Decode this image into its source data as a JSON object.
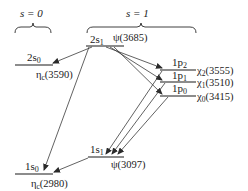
{
  "headers": {
    "s0": "s = 0",
    "s1": "s = 1"
  },
  "levels": {
    "2s1": {
      "state": "2s",
      "sub": "1",
      "particle": "ψ(3685)"
    },
    "2s0": {
      "state": "2s",
      "sub": "0",
      "particle": "η",
      "particle_sub": "c",
      "mass": "(3590)"
    },
    "1p2": {
      "state": "1p",
      "sub": "2",
      "particle": "χ",
      "particle_sub": "2",
      "mass": "(3555)"
    },
    "1p1": {
      "state": "1p",
      "sub": "1",
      "particle": "χ",
      "particle_sub": "1",
      "mass": "(3510)"
    },
    "1p0": {
      "state": "1p",
      "sub": "0",
      "particle": "χ",
      "particle_sub": "0",
      "mass": "(3415)"
    },
    "1s1": {
      "state": "1s",
      "sub": "1",
      "particle": "ψ(3097)"
    },
    "1s0": {
      "state": "1s",
      "sub": "0",
      "particle": "η",
      "particle_sub": "c",
      "mass": "(2980)"
    }
  },
  "transitions": [
    {
      "from": "2s1",
      "to": "2s0"
    },
    {
      "from": "2s1",
      "to": "1s0"
    },
    {
      "from": "2s1",
      "to": "1p2"
    },
    {
      "from": "2s1",
      "to": "1p1"
    },
    {
      "from": "2s1",
      "to": "1p0"
    },
    {
      "from": "1p2",
      "to": "1s1"
    },
    {
      "from": "1p1",
      "to": "1s1"
    },
    {
      "from": "1p0",
      "to": "1s1"
    },
    {
      "from": "1s1",
      "to": "1s0"
    }
  ],
  "colors": {
    "ink": "#1a1a1a",
    "background": "#ffffff"
  }
}
